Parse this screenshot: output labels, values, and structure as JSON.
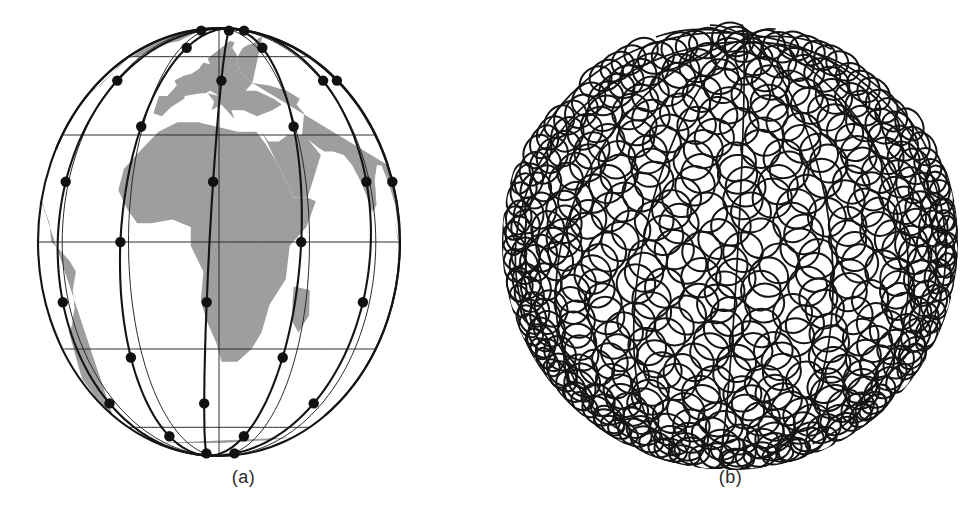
{
  "figure": {
    "background_color": "#ffffff",
    "width": 974,
    "height": 523,
    "panel_count": 2
  },
  "panels": [
    {
      "id": "a",
      "caption": "(a)",
      "title": "Satellite constellation on globe",
      "kind": "globe-constellation"
    },
    {
      "id": "b",
      "caption": "(b)",
      "title": "Coverage footprint circles on globe",
      "kind": "coverage-footprints"
    }
  ],
  "colors": {
    "land": "#9e9e9e",
    "ocean": "#ffffff",
    "orbit_line": "#141414",
    "graticule_line": "#2a2a2a",
    "satellite_dot": "#111111",
    "footprint_circle": "#151515",
    "caption_text": "#2b2b2b",
    "outline": "#141414"
  },
  "chart_data": {
    "type": "scatter",
    "subtitle": "",
    "xlabel": "",
    "ylabel": "",
    "panels": [
      {
        "label": "(a)",
        "description": "Globe in orthographic projection with constellation orbital planes and satellites",
        "globe": {
          "center_x": 219,
          "center_y": 242,
          "radius_x": 181,
          "radius_y": 214,
          "tilt_deg": 0
        },
        "graticule": {
          "parallels_deg": [
            60,
            30,
            0,
            -30,
            -60
          ],
          "meridians_deg": [
            -90,
            -60,
            -30,
            0,
            30,
            60,
            90
          ],
          "line_width": 1
        },
        "orbital_planes": {
          "count": 6,
          "inclination_deg": 86.4,
          "raan_spacing_deg": 30,
          "satellites_per_plane": 11,
          "total_satellites": 66
        },
        "satellites": [
          {
            "plane": 1,
            "lon": -75,
            "lat": 72
          },
          {
            "plane": 1,
            "lon": -78,
            "lat": 36
          },
          {
            "plane": 1,
            "lon": -80,
            "lat": 0
          },
          {
            "plane": 1,
            "lon": -82,
            "lat": -36
          },
          {
            "plane": 1,
            "lon": -84,
            "lat": -70
          },
          {
            "plane": 2,
            "lon": -45,
            "lat": 80
          },
          {
            "plane": 2,
            "lon": -48,
            "lat": 44
          },
          {
            "plane": 2,
            "lon": -50,
            "lat": 8
          },
          {
            "plane": 2,
            "lon": -52,
            "lat": -28
          },
          {
            "plane": 2,
            "lon": -54,
            "lat": -64
          },
          {
            "plane": 3,
            "lon": -15,
            "lat": 84
          },
          {
            "plane": 3,
            "lon": -17,
            "lat": 48
          },
          {
            "plane": 3,
            "lon": -19,
            "lat": 12
          },
          {
            "plane": 3,
            "lon": -21,
            "lat": -24
          },
          {
            "plane": 3,
            "lon": -23,
            "lat": -60
          },
          {
            "plane": 4,
            "lon": 15,
            "lat": 86
          },
          {
            "plane": 4,
            "lon": 13,
            "lat": 50
          },
          {
            "plane": 4,
            "lon": 11,
            "lat": 14
          },
          {
            "plane": 4,
            "lon": 9,
            "lat": -22
          },
          {
            "plane": 4,
            "lon": 7,
            "lat": -58
          },
          {
            "plane": 5,
            "lon": 45,
            "lat": 80
          },
          {
            "plane": 5,
            "lon": 43,
            "lat": 44
          },
          {
            "plane": 5,
            "lon": 41,
            "lat": 8
          },
          {
            "plane": 5,
            "lon": 39,
            "lat": -28
          },
          {
            "plane": 5,
            "lon": 37,
            "lat": -64
          },
          {
            "plane": 6,
            "lon": 75,
            "lat": 72
          },
          {
            "plane": 6,
            "lon": 73,
            "lat": 36
          },
          {
            "plane": 6,
            "lon": 71,
            "lat": 0
          },
          {
            "plane": 6,
            "lon": 69,
            "lat": -36
          },
          {
            "plane": 6,
            "lon": 67,
            "lat": -70
          }
        ]
      },
      {
        "label": "(b)",
        "description": "Sphere covered by overlapping circular satellite coverage footprints",
        "disc": {
          "center_x": 730,
          "center_y": 242,
          "radius": 218
        },
        "footprints": {
          "approx_count": 660,
          "circle_radius_px": 19,
          "pole_convergence_x": 730,
          "pole_convergence_y": 92
        }
      }
    ],
    "legend": [],
    "grid": false
  }
}
